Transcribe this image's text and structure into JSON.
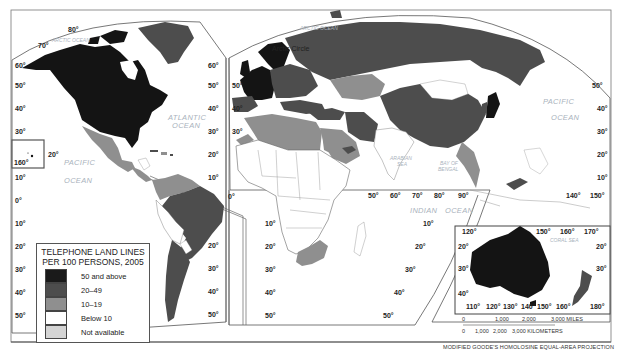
{
  "map": {
    "title": "TELEPHONE LAND LINES PER 100 PERSONS, 2005",
    "projection": "MODIFIED GOODE'S HOMOLOSINE EQUAL-AREA PROJECTION",
    "legend": {
      "title_line1": "TELEPHONE LAND LINES",
      "title_line2": "PER 100 PERSONS, 2005",
      "items": [
        {
          "label": "50 and above",
          "color": "#1a1a1a"
        },
        {
          "label": "20–49",
          "color": "#4d4d4d"
        },
        {
          "label": "10–19",
          "color": "#8f8f8f"
        },
        {
          "label": "Below 10",
          "color": "#ffffff"
        },
        {
          "label": "Not available",
          "color": "#d4d4d4"
        }
      ]
    },
    "oceans": {
      "arctic_west": "ARCTIC OCEAN",
      "arctic_east": "ARCTIC OCEAN",
      "atlantic_1": "ATLANTIC",
      "atlantic_2": "OCEAN",
      "pacific_west_1": "PACIFIC",
      "pacific_west_2": "OCEAN",
      "pacific_east_1": "PACIFIC",
      "pacific_east_2": "OCEAN",
      "indian_1": "INDIAN",
      "indian_2": "OCEAN",
      "arabian_1": "ARABIAN",
      "arabian_2": "SEA",
      "bengal_1": "BAY OF",
      "bengal_2": "BENGAL",
      "coral": "CORAL SEA"
    },
    "arctic_circle": "Arctic Circle",
    "lat_labels_left": [
      "80°",
      "70°",
      "60°",
      "50°",
      "40°",
      "30°",
      "20°",
      "10°",
      "0°",
      "10°",
      "20°",
      "30°",
      "40°",
      "50°"
    ],
    "hawaii_lon": "160°",
    "lon_labels_indian": [
      "50°",
      "60°",
      "70°",
      "80°",
      "90°"
    ],
    "lon_labels_pacific": [
      "140°",
      "150°"
    ],
    "australia_top": [
      "120°",
      "150°",
      "160°",
      "170°"
    ],
    "australia_bottom": [
      "110°",
      "120°",
      "130°",
      "140°",
      "150°",
      "160°",
      "180°"
    ],
    "australia_lat": [
      "20°",
      "30°",
      "40°",
      "20°",
      "30°"
    ],
    "scale": {
      "miles": [
        "0",
        "1,000",
        "2,000",
        "3,000 MILES"
      ],
      "km": [
        "0",
        "1,000",
        "2,000",
        "3,000 KILOMETERS"
      ]
    }
  }
}
